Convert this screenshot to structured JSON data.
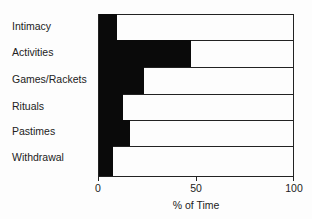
{
  "chart_data": {
    "type": "bar",
    "orientation": "horizontal",
    "title": "",
    "xlabel": "% of Time",
    "ylabel": "",
    "xlim": [
      0,
      100
    ],
    "xticks": [
      "0",
      "50",
      "100"
    ],
    "grid": false,
    "legend": null,
    "categories": [
      "Intimacy",
      "Activities",
      "Games/Rackets",
      "Rituals",
      "Pastimes",
      "Withdrawal"
    ],
    "values": [
      9,
      47,
      23,
      12,
      16,
      7
    ]
  }
}
